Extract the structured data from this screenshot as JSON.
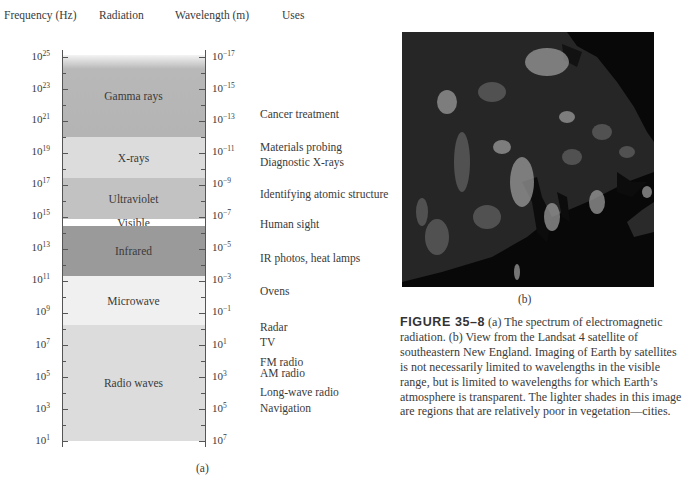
{
  "chart_data": {
    "type": "table",
    "title": "The spectrum of electromagnetic radiation",
    "columns": [
      "Frequency (Hz)",
      "Radiation",
      "Wavelength (m)",
      "Uses"
    ],
    "frequency_ticks": [
      "10^25",
      "10^23",
      "10^21",
      "10^19",
      "10^17",
      "10^15",
      "10^13",
      "10^11",
      "10^9",
      "10^7",
      "10^5",
      "10^3",
      "10^1"
    ],
    "wavelength_ticks": [
      "10^-17",
      "10^-15",
      "10^-13",
      "10^-11",
      "10^-9",
      "10^-7",
      "10^-5",
      "10^-3",
      "10^-1",
      "10^1",
      "10^3",
      "10^5",
      "10^7"
    ],
    "bands": [
      {
        "name": "Gamma rays",
        "freq_range_log10": [
          20,
          25
        ],
        "shade": "#b4b4b4"
      },
      {
        "name": "X-rays",
        "freq_range_log10": [
          17.5,
          20
        ],
        "shade": "#dcdcdc"
      },
      {
        "name": "Ultraviolet",
        "freq_range_log10": [
          15,
          17.5
        ],
        "shade": "#c2c2c2"
      },
      {
        "name": "Visible",
        "freq_range_log10": [
          14.6,
          15
        ],
        "shade": "#ffffff"
      },
      {
        "name": "Infrared",
        "freq_range_log10": [
          11.5,
          14.6
        ],
        "shade": "#9a9a9a"
      },
      {
        "name": "Microwave",
        "freq_range_log10": [
          8.5,
          11.5
        ],
        "shade": "#f0f0f0"
      },
      {
        "name": "Radio waves",
        "freq_range_log10": [
          1,
          8.5
        ],
        "shade": "#dcdcdc"
      }
    ],
    "uses": [
      {
        "label": "Cancer treatment",
        "wavelength_log10": -13
      },
      {
        "label": "Materials probing",
        "wavelength_log10": -11
      },
      {
        "label": "Diagnostic X-rays",
        "wavelength_log10": -10.5
      },
      {
        "label": "Identifying atomic structure",
        "wavelength_log10": -8.8
      },
      {
        "label": "Human sight",
        "wavelength_log10": -6.6
      },
      {
        "label": "IR photos, heat lamps",
        "wavelength_log10": -4.2
      },
      {
        "label": "Ovens",
        "wavelength_log10": -2
      },
      {
        "label": "Radar",
        "wavelength_log10": 0.2
      },
      {
        "label": "TV",
        "wavelength_log10": 0.9
      },
      {
        "label": "FM radio",
        "wavelength_log10": 2.1
      },
      {
        "label": "AM radio",
        "wavelength_log10": 2.6
      },
      {
        "label": "Long-wave radio",
        "wavelength_log10": 3.9
      },
      {
        "label": "Navigation",
        "wavelength_log10": 4.8
      }
    ]
  },
  "headers": {
    "frequency": "Frequency (Hz)",
    "radiation": "Radiation",
    "wavelength": "Wavelength (m)",
    "uses": "Uses"
  },
  "freq_labels": [
    {
      "base": "10",
      "exp": "25"
    },
    {
      "base": "10",
      "exp": "23"
    },
    {
      "base": "10",
      "exp": "21"
    },
    {
      "base": "10",
      "exp": "19"
    },
    {
      "base": "10",
      "exp": "17"
    },
    {
      "base": "10",
      "exp": "15"
    },
    {
      "base": "10",
      "exp": "13"
    },
    {
      "base": "10",
      "exp": "11"
    },
    {
      "base": "10",
      "exp": "9"
    },
    {
      "base": "10",
      "exp": "7"
    },
    {
      "base": "10",
      "exp": "5"
    },
    {
      "base": "10",
      "exp": "3"
    },
    {
      "base": "10",
      "exp": "1"
    }
  ],
  "wave_labels": [
    {
      "base": "10",
      "exp": "−17"
    },
    {
      "base": "10",
      "exp": "−15"
    },
    {
      "base": "10",
      "exp": "−13"
    },
    {
      "base": "10",
      "exp": "−11"
    },
    {
      "base": "10",
      "exp": "−9"
    },
    {
      "base": "10",
      "exp": "−7"
    },
    {
      "base": "10",
      "exp": "−5"
    },
    {
      "base": "10",
      "exp": "−3"
    },
    {
      "base": "10",
      "exp": "−1"
    },
    {
      "base": "10",
      "exp": "1"
    },
    {
      "base": "10",
      "exp": "3"
    },
    {
      "base": "10",
      "exp": "5"
    },
    {
      "base": "10",
      "exp": "7"
    }
  ],
  "bands": {
    "gamma": "Gamma rays",
    "xray": "X-rays",
    "uv": "Ultraviolet",
    "visible": "Visible",
    "ir": "Infrared",
    "microwave": "Microwave",
    "radio": "Radio waves"
  },
  "uses": {
    "cancer": "Cancer treatment",
    "materials": "Materials probing",
    "diagnostic": "Diagnostic X-rays",
    "atomic": "Identifying atomic structure",
    "sight": "Human sight",
    "ir": "IR photos, heat lamps",
    "ovens": "Ovens",
    "radar": "Radar",
    "tv": "TV",
    "fm": "FM radio",
    "am": "AM radio",
    "longwave": "Long-wave radio",
    "navigation": "Navigation"
  },
  "captions": {
    "a": "(a)",
    "b": "(b)",
    "figure_label": "FIGURE 35–8",
    "figure_text": " (a) The spectrum of electromagnetic radiation. (b) View from the Landsat 4 satellite of southeastern New England. Imaging of Earth by satellites is not necessarily limited to wavelengths in the visible range, but is limited to wavelengths for which Earth’s atmosphere is transparent. The lighter shades in this image are regions that are relatively poor in vegetation—cities."
  },
  "colors": {
    "gamma": "#b4b4b4",
    "xray": "#dcdcdc",
    "uv": "#c2c2c2",
    "visible": "#ffffff",
    "ir": "#9a9a9a",
    "microwave": "#f0f0f0",
    "radio": "#dcdcdc"
  }
}
